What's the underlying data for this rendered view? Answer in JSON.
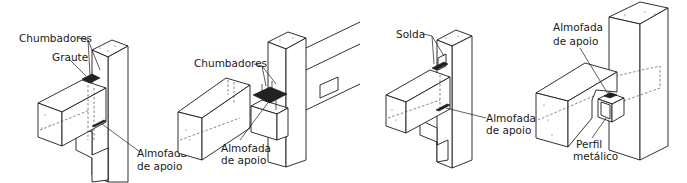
{
  "diagram": {
    "type": "technical-illustration",
    "panels": [
      {
        "id": "panel-1",
        "labels": {
          "chumbadores": "Chumbadores",
          "graute": "Graute",
          "almofada_line1": "Almofada",
          "almofada_line2": "de apoio"
        }
      },
      {
        "id": "panel-2",
        "labels": {
          "chumbadores": "Chumbadores",
          "almofada_line1": "Almofada",
          "almofada_line2": "de apoio"
        }
      },
      {
        "id": "panel-3",
        "labels": {
          "solda": "Solda",
          "almofada_line1": "Almofada",
          "almofada_line2": "de apoio"
        }
      },
      {
        "id": "panel-4",
        "labels": {
          "almofada_line1": "Almofada",
          "almofada_line2": "de apoio",
          "perfil_line1": "Perfil",
          "perfil_line2": "metálico"
        }
      }
    ]
  }
}
